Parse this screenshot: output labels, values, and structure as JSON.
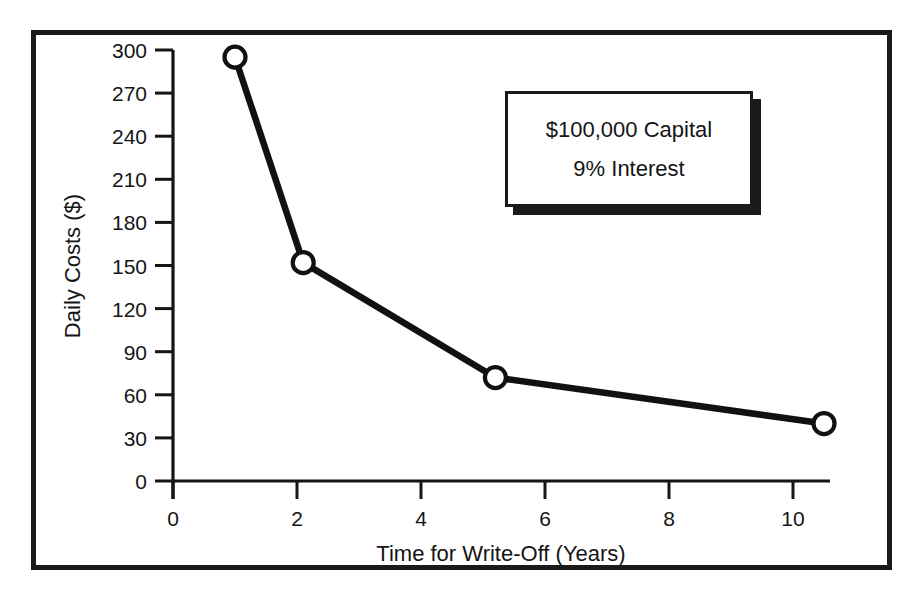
{
  "chart_data": {
    "type": "line",
    "title": "",
    "xlabel": "Time for Write-Off (Years)",
    "ylabel": "Daily Costs ($)",
    "xlim": [
      0,
      10.6
    ],
    "ylim": [
      0,
      300
    ],
    "grid": false,
    "legend": "none",
    "marker": "open-circle",
    "line_color": "#111111",
    "marker_fill": "#ffffff",
    "xticks": [
      "0",
      "2",
      "4",
      "6",
      "8",
      "10"
    ],
    "xtick_values": [
      0,
      2,
      4,
      6,
      8,
      10
    ],
    "yticks": [
      "0",
      "30",
      "60",
      "90",
      "120",
      "150",
      "180",
      "210",
      "240",
      "270",
      "300"
    ],
    "ytick_values": [
      0,
      30,
      60,
      90,
      120,
      150,
      180,
      210,
      240,
      270,
      300
    ],
    "series": [
      {
        "name": "Daily Costs",
        "x": [
          1.0,
          2.1,
          5.2,
          10.5
        ],
        "values": [
          295,
          152,
          72,
          40
        ]
      }
    ],
    "annotations": [
      {
        "text": "$100,000 Capital"
      },
      {
        "text": "9% Interest"
      }
    ]
  }
}
